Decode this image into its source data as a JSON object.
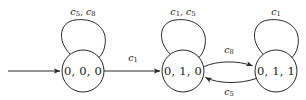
{
  "figure": {
    "background_color": "#ffffff",
    "stroke_color": "#2a2a2a",
    "text_color": "#1a1a1a",
    "width": 306,
    "height": 100
  },
  "states": [
    {
      "id": "s0",
      "label": "0, 0, 0",
      "cx": 83,
      "cy": 71,
      "r": 21,
      "initial": true
    },
    {
      "id": "s1",
      "label": "0, 1, 0",
      "cx": 183,
      "cy": 71,
      "r": 21,
      "initial": false
    },
    {
      "id": "s2",
      "label": "0, 1, 1",
      "cx": 276,
      "cy": 71,
      "r": 21,
      "initial": false
    }
  ],
  "self_loops": [
    {
      "id": "loop0",
      "state": "s0",
      "label_base_1": "c",
      "label_sub_1": "5",
      "label_sep": ", ",
      "label_base_2": "c",
      "label_sub_2": "8",
      "label_text": "c5, c8",
      "label_x": 83,
      "label_y": 11
    },
    {
      "id": "loop1",
      "state": "s1",
      "label_base_1": "c",
      "label_sub_1": "1",
      "label_sep": ", ",
      "label_base_2": "c",
      "label_sub_2": "5",
      "label_text": "c1, c5",
      "label_x": 183,
      "label_y": 11
    },
    {
      "id": "loop2",
      "state": "s2",
      "label_base_1": "c",
      "label_sub_1": "1",
      "label_sep": "",
      "label_base_2": "",
      "label_sub_2": "",
      "label_text": "c1",
      "label_x": 276,
      "label_y": 11
    }
  ],
  "transitions": [
    {
      "id": "t0",
      "from": "s0",
      "to": "s1",
      "label_base": "c",
      "label_sub": "1",
      "label_text": "c1",
      "label_x": 133,
      "label_y": 58
    },
    {
      "id": "t1",
      "from": "s1",
      "to": "s2",
      "label_base": "c",
      "label_sub": "8",
      "label_text": "c8",
      "label_x": 229,
      "label_y": 50
    },
    {
      "id": "t2",
      "from": "s2",
      "to": "s1",
      "label_base": "c",
      "label_sub": "5",
      "label_text": "c5",
      "label_x": 229,
      "label_y": 92
    }
  ],
  "initial_arrow": {
    "id": "start",
    "from_x": 8,
    "to_x": 61,
    "y": 71,
    "label": ""
  }
}
